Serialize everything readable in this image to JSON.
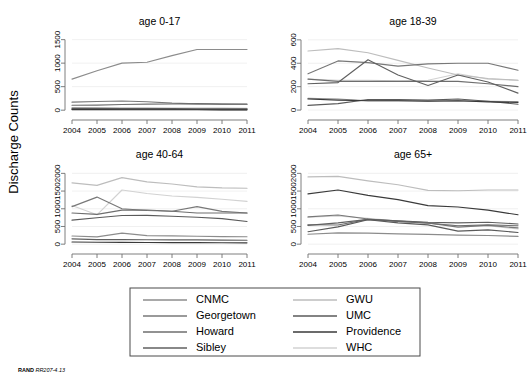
{
  "figure": {
    "axis_title_y": "Discharge Counts",
    "credit_bold": "RAND",
    "credit_italic": "RR207-4.13"
  },
  "legend": {
    "entries": [
      {
        "label": "CNMC",
        "color": "#8c8c8c",
        "column": 0,
        "row": 0
      },
      {
        "label": "Georgetown",
        "color": "#787878",
        "column": 0,
        "row": 1
      },
      {
        "label": "Howard",
        "color": "#6e6e6e",
        "column": 0,
        "row": 2
      },
      {
        "label": "Sibley",
        "color": "#606060",
        "column": 0,
        "row": 3
      },
      {
        "label": "GWU",
        "color": "#bdbdbd",
        "column": 1,
        "row": 0
      },
      {
        "label": "UMC",
        "color": "#5a5a5a",
        "column": 1,
        "row": 1
      },
      {
        "label": "Providence",
        "color": "#3a3a3a",
        "column": 1,
        "row": 2
      },
      {
        "label": "WHC",
        "color": "#d2d2d2",
        "column": 1,
        "row": 3
      }
    ]
  },
  "chart_data": [
    {
      "type": "line",
      "title": "age 0-17",
      "xlabel": "",
      "ylabel": "Discharge Counts",
      "x": [
        2004,
        2005,
        2006,
        2007,
        2008,
        2009,
        2010,
        2011
      ],
      "xticks": [
        "2004",
        "2005",
        "2006",
        "2007",
        "2008",
        "2009",
        "2010",
        "2011"
      ],
      "yticks": [
        0,
        500,
        1000,
        1500
      ],
      "ylim": [
        -60,
        1620
      ],
      "grid": true,
      "series": [
        {
          "name": "CNMC",
          "color": "#8c8c8c",
          "values": [
            660,
            840,
            1000,
            1020,
            1160,
            1290,
            1290,
            1290
          ]
        },
        {
          "name": "Georgetown",
          "color": "#787878",
          "values": [
            170,
            185,
            195,
            180,
            150,
            135,
            130,
            130
          ]
        },
        {
          "name": "Howard",
          "color": "#6e6e6e",
          "values": [
            105,
            108,
            120,
            130,
            132,
            140,
            128,
            125
          ]
        },
        {
          "name": "Sibley",
          "color": "#606060",
          "values": [
            20,
            18,
            16,
            15,
            14,
            14,
            13,
            13
          ]
        },
        {
          "name": "GWU",
          "color": "#bdbdbd",
          "values": [
            55,
            52,
            50,
            48,
            46,
            45,
            44,
            42
          ]
        },
        {
          "name": "UMC",
          "color": "#5a5a5a",
          "values": [
            40,
            38,
            36,
            34,
            32,
            30,
            30,
            28
          ]
        },
        {
          "name": "Providence",
          "color": "#3a3a3a",
          "values": [
            12,
            11,
            10,
            10,
            9,
            9,
            8,
            8
          ]
        },
        {
          "name": "WHC",
          "color": "#d2d2d2",
          "values": [
            35,
            34,
            33,
            32,
            30,
            30,
            29,
            28
          ]
        }
      ]
    },
    {
      "type": "line",
      "title": "age 18-39",
      "xlabel": "",
      "ylabel": "Discharge Counts",
      "x": [
        2004,
        2005,
        2006,
        2007,
        2008,
        2009,
        2010,
        2011
      ],
      "xticks": [
        "2004",
        "2005",
        "2006",
        "2007",
        "2008",
        "2009",
        "2010",
        "2011"
      ],
      "yticks": [
        0,
        200,
        400,
        600
      ],
      "ylim": [
        -25,
        650
      ],
      "grid": true,
      "series": [
        {
          "name": "CNMC",
          "color": "#8c8c8c",
          "values": [
            100,
            95,
            80,
            82,
            78,
            80,
            75,
            72
          ]
        },
        {
          "name": "Georgetown",
          "color": "#787878",
          "values": [
            310,
            420,
            405,
            375,
            395,
            400,
            400,
            340
          ]
        },
        {
          "name": "Howard",
          "color": "#6e6e6e",
          "values": [
            265,
            245,
            245,
            245,
            245,
            245,
            225,
            200
          ]
        },
        {
          "name": "Sibley",
          "color": "#606060",
          "values": [
            225,
            235,
            430,
            300,
            210,
            300,
            240,
            145
          ]
        },
        {
          "name": "GWU",
          "color": "#bdbdbd",
          "values": [
            505,
            525,
            490,
            425,
            360,
            300,
            270,
            255
          ]
        },
        {
          "name": "UMC",
          "color": "#5a5a5a",
          "values": [
            40,
            55,
            90,
            90,
            85,
            95,
            75,
            50
          ]
        },
        {
          "name": "Providence",
          "color": "#3a3a3a",
          "values": [
            95,
            85,
            80,
            80,
            75,
            80,
            70,
            65
          ]
        },
        {
          "name": "WHC",
          "color": "#d2d2d2",
          "values": [
            265,
            255,
            255,
            250,
            255,
            310,
            265,
            255
          ]
        }
      ]
    },
    {
      "type": "line",
      "title": "age 40-64",
      "xlabel": "",
      "ylabel": "Discharge Counts",
      "x": [
        2004,
        2005,
        2006,
        2007,
        2008,
        2009,
        2010,
        2011
      ],
      "xticks": [
        "2004",
        "2005",
        "2006",
        "2007",
        "2008",
        "2009",
        "2010",
        "2011"
      ],
      "yticks": [
        0,
        500,
        1000,
        1500,
        2000
      ],
      "ylim": [
        -80,
        2180
      ],
      "grid": true,
      "series": [
        {
          "name": "CNMC",
          "color": "#8c8c8c",
          "values": [
            230,
            205,
            310,
            240,
            235,
            225,
            215,
            210
          ]
        },
        {
          "name": "Georgetown",
          "color": "#787878",
          "values": [
            1060,
            1330,
            1000,
            950,
            930,
            1060,
            925,
            880
          ]
        },
        {
          "name": "Howard",
          "color": "#6e6e6e",
          "values": [
            880,
            840,
            960,
            965,
            930,
            880,
            880,
            880
          ]
        },
        {
          "name": "Sibley",
          "color": "#606060",
          "values": [
            150,
            130,
            130,
            125,
            120,
            120,
            115,
            110
          ]
        },
        {
          "name": "GWU",
          "color": "#bdbdbd",
          "values": [
            1730,
            1660,
            1880,
            1760,
            1700,
            1620,
            1590,
            1580
          ]
        },
        {
          "name": "UMC",
          "color": "#5a5a5a",
          "values": [
            680,
            745,
            810,
            815,
            790,
            760,
            720,
            640
          ]
        },
        {
          "name": "Providence",
          "color": "#3a3a3a",
          "values": [
            60,
            55,
            50,
            48,
            45,
            42,
            40,
            38
          ]
        },
        {
          "name": "WHC",
          "color": "#d2d2d2",
          "values": [
            1090,
            830,
            1530,
            1430,
            1360,
            1320,
            1270,
            1210
          ]
        }
      ]
    },
    {
      "type": "line",
      "title": "age 65+",
      "xlabel": "",
      "ylabel": "Discharge Counts",
      "x": [
        2004,
        2005,
        2006,
        2007,
        2008,
        2009,
        2010,
        2011
      ],
      "xticks": [
        "2004",
        "2005",
        "2006",
        "2007",
        "2008",
        "2009",
        "2010",
        "2011"
      ],
      "yticks": [
        0,
        500,
        1000,
        1500,
        2000
      ],
      "ylim": [
        -80,
        2180
      ],
      "grid": true,
      "series": [
        {
          "name": "CNMC",
          "color": "#8c8c8c",
          "values": [
            280,
            320,
            310,
            290,
            275,
            255,
            245,
            220
          ]
        },
        {
          "name": "Georgetown",
          "color": "#787878",
          "values": [
            770,
            825,
            710,
            650,
            600,
            480,
            530,
            460
          ]
        },
        {
          "name": "Howard",
          "color": "#6e6e6e",
          "values": [
            550,
            540,
            700,
            640,
            590,
            520,
            545,
            520
          ]
        },
        {
          "name": "Sibley",
          "color": "#606060",
          "values": [
            530,
            600,
            700,
            660,
            620,
            600,
            620,
            570
          ]
        },
        {
          "name": "GWU",
          "color": "#bdbdbd",
          "values": [
            1900,
            1915,
            1790,
            1680,
            1520,
            1510,
            1530,
            1530
          ]
        },
        {
          "name": "UMC",
          "color": "#5a5a5a",
          "values": [
            350,
            490,
            690,
            600,
            545,
            370,
            405,
            330
          ]
        },
        {
          "name": "Providence",
          "color": "#3a3a3a",
          "values": [
            1420,
            1530,
            1380,
            1260,
            1090,
            1050,
            960,
            830
          ]
        },
        {
          "name": "WHC",
          "color": "#d2d2d2",
          "values": [
            760,
            800,
            730,
            650,
            600,
            520,
            520,
            430
          ]
        }
      ]
    }
  ]
}
